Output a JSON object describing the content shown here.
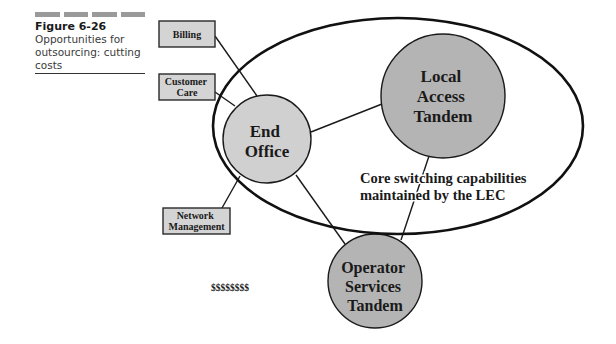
{
  "caption": {
    "figure_number": "Figure 6-26",
    "text": "Opportunities for outsourcing: cutting costs"
  },
  "boxes": [
    {
      "id": "billing",
      "lines": [
        "Billing"
      ]
    },
    {
      "id": "customer-care",
      "lines": [
        "Customer",
        "Care"
      ]
    },
    {
      "id": "network-management",
      "lines": [
        "Network",
        "Management"
      ]
    }
  ],
  "nodes": [
    {
      "id": "end-office",
      "lines": [
        "End",
        "Office"
      ]
    },
    {
      "id": "local-access-tandem",
      "lines": [
        "Local",
        "Access",
        "Tandem"
      ]
    },
    {
      "id": "operator-services-tandem",
      "lines": [
        "Operator",
        "Services",
        "Tandem"
      ]
    }
  ],
  "region_label": {
    "lines": [
      "Core switching capabilities",
      "maintained by the LEC"
    ]
  },
  "cost_label": "$$$$$$$$",
  "colors": {
    "box_fill": "#d4d4d4",
    "end_office_fill": "#d0d0d0",
    "tandem_fill": "#b4b4b4",
    "stroke": "#1a1a1a",
    "dash": "#9a9a9a"
  }
}
